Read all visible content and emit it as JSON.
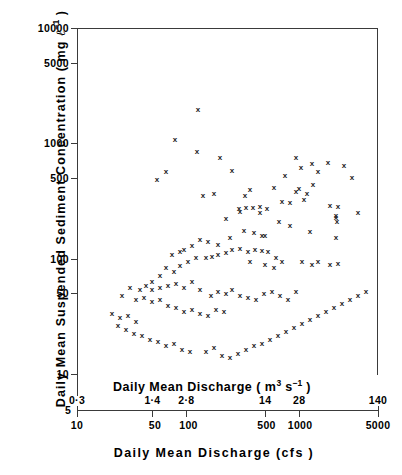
{
  "figure": {
    "background": "#ffffff",
    "ink_color": "#3a3a3a"
  },
  "axes": {
    "y": {
      "title_parts": {
        "main": "Daily  Mean  Suspended  Sediment  Concentration  ( mg ",
        "unit_symbol": "ℓ",
        "unit_exponent": "−1",
        "closing": " )"
      },
      "title_plain": "Daily Mean Suspended Sediment Concentration ( mg l-1 )",
      "scale": "log",
      "range": [
        5,
        10000
      ],
      "ticks": [
        {
          "label": "10000",
          "value": 10000
        },
        {
          "label": "5000",
          "value": 5000
        },
        {
          "label": "1000",
          "value": 1000
        },
        {
          "label": "500",
          "value": 500
        },
        {
          "label": "100",
          "value": 100
        },
        {
          "label": "50",
          "value": 50
        },
        {
          "label": "10",
          "value": 10
        }
      ]
    },
    "x_metric": {
      "title_parts": {
        "main": "Daily Mean Discharge  ( m",
        "exp1": "3",
        "mid": " s",
        "exp2": "−1",
        "closing": " )"
      },
      "title_plain": "Daily Mean Discharge ( m3 s-1 )",
      "scale": "log",
      "range": [
        0.3,
        140
      ],
      "ticks": [
        {
          "label": "0·3",
          "value": 0.3,
          "endpoint": true
        },
        {
          "label": "1·4",
          "value": 1.4
        },
        {
          "label": "2·8",
          "value": 2.8
        },
        {
          "label": "14",
          "value": 14
        },
        {
          "label": "28",
          "value": 28
        },
        {
          "label": "140",
          "value": 140,
          "endpoint": true
        }
      ]
    },
    "x_cfs": {
      "title": "Daily    Mean    Discharge   (cfs )",
      "scale": "log",
      "range": [
        10,
        5000
      ],
      "ticks": [
        {
          "label": "5",
          "value": 5,
          "endpoint": true
        },
        {
          "label": "10",
          "value": 10
        },
        {
          "label": "50",
          "value": 50
        },
        {
          "label": "100",
          "value": 100
        },
        {
          "label": "500",
          "value": 500
        },
        {
          "label": "1000",
          "value": 1000
        },
        {
          "label": "5000",
          "value": 5000,
          "endpoint": true
        }
      ]
    }
  },
  "chart_data": {
    "type": "scatter",
    "title": "",
    "xlabel": "Daily Mean Discharge (cfs)",
    "ylabel": "Daily Mean Suspended Sediment Concentration (mg l-1)",
    "xscale": "log",
    "yscale": "log",
    "xlim": [
      10,
      5000
    ],
    "ylim": [
      10,
      10000
    ],
    "grid": false,
    "legend": null,
    "marker": "x",
    "marker_color": "#1a1a1a",
    "secondary_xaxis": {
      "label": "Daily Mean Discharge (m3 s-1)",
      "xlim": [
        0.3,
        140
      ],
      "conversion": "1 m3/s = 35.31 cfs"
    },
    "n_points": 104,
    "x": [
      184,
      139,
      216,
      148,
      131,
      252,
      128,
      264,
      336,
      810,
      881,
      766,
      795,
      914,
      803,
      909,
      1010,
      75,
      81,
      96,
      106,
      113,
      142,
      150,
      163,
      180,
      200,
      212,
      226,
      238,
      252,
      262,
      278,
      290,
      300,
      316,
      334,
      349,
      366,
      380,
      402,
      420,
      440,
      455,
      480,
      500,
      520,
      545,
      566,
      590,
      612,
      640,
      663,
      690,
      712,
      740,
      770,
      800,
      836,
      870,
      62,
      68,
      74,
      80,
      86,
      92,
      99,
      105,
      112,
      119,
      126,
      134,
      141,
      149,
      157,
      38,
      41,
      44,
      47,
      50,
      54,
      57,
      61,
      65,
      70,
      74,
      79,
      84,
      90,
      95,
      44,
      47,
      51,
      55,
      59,
      64,
      68,
      73,
      78,
      84,
      90,
      97,
      104,
      112
    ],
    "y": [
      1800,
      760,
      1000,
      500,
      420,
      700,
      310,
      370,
      340,
      700,
      610,
      530,
      410,
      700,
      400,
      330,
      300,
      26,
      30,
      33,
      35,
      38,
      40,
      44,
      50,
      52,
      58,
      60,
      65,
      68,
      74,
      80,
      88,
      95,
      100,
      105,
      110,
      120,
      130,
      140,
      150,
      160,
      175,
      190,
      200,
      215,
      230,
      245,
      260,
      275,
      290,
      300,
      255,
      310,
      230,
      265,
      290,
      310,
      255,
      100,
      110,
      120,
      130,
      140,
      150,
      160,
      170,
      180,
      195,
      210,
      225,
      240,
      255,
      270,
      285,
      28,
      30,
      33,
      36,
      40,
      44,
      48,
      52,
      56,
      60,
      64,
      68,
      72,
      77,
      82,
      16,
      17,
      18,
      19,
      20,
      22,
      24,
      26,
      28,
      30,
      33,
      36,
      40,
      44
    ]
  },
  "points_pixels": [
    [
      198,
      110
    ],
    [
      175,
      140
    ],
    [
      197,
      152
    ],
    [
      220,
      158
    ],
    [
      166,
      172
    ],
    [
      157,
      180
    ],
    [
      232,
      171
    ],
    [
      250,
      190
    ],
    [
      285,
      176
    ],
    [
      274,
      188
    ],
    [
      245,
      196
    ],
    [
      282,
      202
    ],
    [
      203,
      196
    ],
    [
      214,
      194
    ],
    [
      260,
      207
    ],
    [
      239,
      209
    ],
    [
      246,
      208
    ],
    [
      253,
      208
    ],
    [
      267,
      209
    ],
    [
      240,
      212
    ],
    [
      260,
      213
    ],
    [
      226,
      219
    ],
    [
      290,
      203
    ],
    [
      296,
      192
    ],
    [
      299,
      189
    ],
    [
      307,
      194
    ],
    [
      304,
      200
    ],
    [
      313,
      185
    ],
    [
      318,
      172
    ],
    [
      312,
      164
    ],
    [
      301,
      168
    ],
    [
      296,
      158
    ],
    [
      328,
      163
    ],
    [
      344,
      166
    ],
    [
      352,
      178
    ],
    [
      330,
      206
    ],
    [
      338,
      207
    ],
    [
      336,
      216
    ],
    [
      336,
      218
    ],
    [
      337,
      222
    ],
    [
      336,
      238
    ],
    [
      358,
      213
    ],
    [
      290,
      226
    ],
    [
      279,
      222
    ],
    [
      310,
      232
    ],
    [
      265,
      236
    ],
    [
      244,
      231
    ],
    [
      254,
      233
    ],
    [
      262,
      236
    ],
    [
      230,
      238
    ],
    [
      218,
      245
    ],
    [
      208,
      242
    ],
    [
      200,
      240
    ],
    [
      192,
      246
    ],
    [
      184,
      250
    ],
    [
      180,
      252
    ],
    [
      172,
      255
    ],
    [
      206,
      258
    ],
    [
      212,
      257
    ],
    [
      218,
      255
    ],
    [
      226,
      253
    ],
    [
      232,
      250
    ],
    [
      240,
      249
    ],
    [
      248,
      252
    ],
    [
      255,
      250
    ],
    [
      262,
      251
    ],
    [
      268,
      252
    ],
    [
      250,
      262
    ],
    [
      265,
      265
    ],
    [
      274,
      268
    ],
    [
      282,
      262
    ],
    [
      302,
      262
    ],
    [
      312,
      265
    ],
    [
      318,
      262
    ],
    [
      330,
      265
    ],
    [
      338,
      264
    ],
    [
      276,
      258
    ],
    [
      180,
      266
    ],
    [
      188,
      262
    ],
    [
      196,
      258
    ],
    [
      166,
      268
    ],
    [
      174,
      272
    ],
    [
      160,
      276
    ],
    [
      152,
      282
    ],
    [
      146,
      286
    ],
    [
      140,
      290
    ],
    [
      152,
      290
    ],
    [
      160,
      288
    ],
    [
      168,
      286
    ],
    [
      176,
      284
    ],
    [
      184,
      288
    ],
    [
      192,
      282
    ],
    [
      200,
      290
    ],
    [
      211,
      296
    ],
    [
      218,
      292
    ],
    [
      226,
      294
    ],
    [
      232,
      290
    ],
    [
      240,
      296
    ],
    [
      248,
      298
    ],
    [
      256,
      300
    ],
    [
      264,
      294
    ],
    [
      272,
      292
    ],
    [
      280,
      296
    ],
    [
      288,
      300
    ],
    [
      296,
      292
    ],
    [
      130,
      288
    ],
    [
      122,
      296
    ],
    [
      136,
      300
    ],
    [
      144,
      298
    ],
    [
      152,
      302
    ],
    [
      160,
      300
    ],
    [
      168,
      306
    ],
    [
      176,
      308
    ],
    [
      184,
      312
    ],
    [
      192,
      310
    ],
    [
      200,
      314
    ],
    [
      208,
      316
    ],
    [
      216,
      310
    ],
    [
      224,
      312
    ],
    [
      112,
      314
    ],
    [
      120,
      318
    ],
    [
      128,
      316
    ],
    [
      136,
      322
    ],
    [
      118,
      326
    ],
    [
      126,
      330
    ],
    [
      134,
      334
    ],
    [
      142,
      336
    ],
    [
      150,
      340
    ],
    [
      158,
      342
    ],
    [
      166,
      346
    ],
    [
      174,
      344
    ],
    [
      182,
      350
    ],
    [
      190,
      352
    ],
    [
      206,
      352
    ],
    [
      214,
      348
    ],
    [
      222,
      356
    ],
    [
      230,
      358
    ],
    [
      238,
      354
    ],
    [
      246,
      350
    ],
    [
      254,
      346
    ],
    [
      262,
      344
    ],
    [
      270,
      340
    ],
    [
      278,
      336
    ],
    [
      286,
      332
    ],
    [
      294,
      328
    ],
    [
      302,
      324
    ],
    [
      310,
      320
    ],
    [
      318,
      316
    ],
    [
      326,
      312
    ],
    [
      334,
      308
    ],
    [
      342,
      304
    ],
    [
      350,
      300
    ],
    [
      358,
      296
    ],
    [
      366,
      292
    ]
  ]
}
